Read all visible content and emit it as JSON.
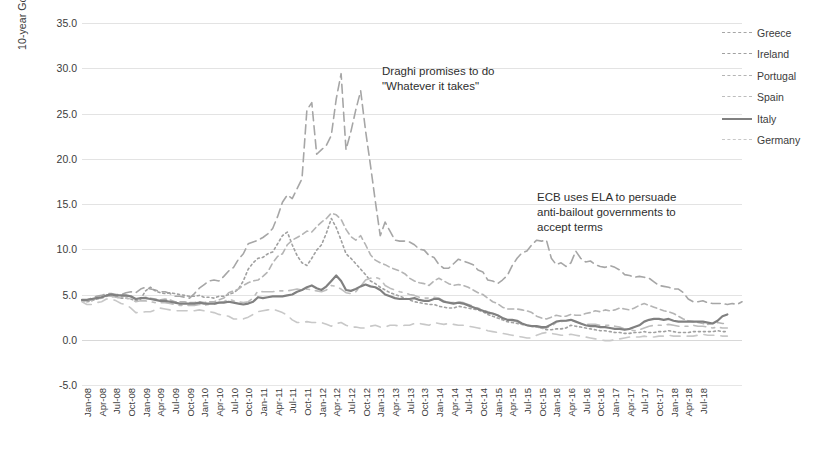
{
  "chart_data": {
    "type": "line",
    "title": "",
    "xlabel": "",
    "ylabel": "10-year Government Bond Yeilds, Percent",
    "ylim": [
      -5.0,
      35.0
    ],
    "ytick_labels": [
      "35.0",
      "30.0",
      "25.0",
      "20.0",
      "15.0",
      "10.0",
      "5.0",
      "0.0",
      "-5.0"
    ],
    "ytick_values": [
      35.0,
      30.0,
      25.0,
      20.0,
      15.0,
      10.0,
      5.0,
      0.0,
      -5.0
    ],
    "grid": true,
    "legend_position": "right",
    "x_tick_labels": [
      "Jan-08",
      "Apr-08",
      "Jul-08",
      "Oct-08",
      "Jan-09",
      "Apr-09",
      "Jul-09",
      "Oct-09",
      "Jan-10",
      "Apr-10",
      "Jul-10",
      "Oct-10",
      "Jan-11",
      "Apr-11",
      "Jul-11",
      "Oct-11",
      "Jan-12",
      "Apr-12",
      "Jul-12",
      "Oct-12",
      "Jan-13",
      "Apr-13",
      "Jul-13",
      "Oct-13",
      "Jan-14",
      "Apr-14",
      "Jul-14",
      "Oct-14",
      "Jan-15",
      "Apr-15",
      "Jul-15",
      "Oct-15",
      "Jan-16",
      "Apr-16",
      "Jul-16",
      "Oct-16",
      "Jan-17",
      "Apr-17",
      "Jul-17",
      "Oct-17",
      "Jan-18",
      "Apr-18",
      "Jul-18"
    ],
    "x_months_start": "Jan-08",
    "x_months_end": "Jul-18",
    "series": [
      {
        "name": "Greece",
        "color": "#a6a6a6",
        "dash": "9 5",
        "width": 1.6,
        "values": [
          4.4,
          4.4,
          4.6,
          4.8,
          4.9,
          5.1,
          5.1,
          5.0,
          5.0,
          5.2,
          5.3,
          5.2,
          5.6,
          5.8,
          5.6,
          5.5,
          5.3,
          5.3,
          5.1,
          4.8,
          4.8,
          4.7,
          4.6,
          5.1,
          5.7,
          6.1,
          6.5,
          6.6,
          6.5,
          7.0,
          7.6,
          8.0,
          8.9,
          9.5,
          10.6,
          10.8,
          11.0,
          11.3,
          11.7,
          12.3,
          13.6,
          15.2,
          16.0,
          15.6,
          16.7,
          17.8,
          25.4,
          26.2,
          20.5,
          21.0,
          21.5,
          22.6,
          26.6,
          29.4,
          21.0,
          23.0,
          25.4,
          27.5,
          23.1,
          19.3,
          15.3,
          11.5,
          13.0,
          12.0,
          11.0,
          10.9,
          10.9,
          10.8,
          10.5,
          10.0,
          9.9,
          9.3,
          9.1,
          8.3,
          7.9,
          7.9,
          8.4,
          8.9,
          8.7,
          8.5,
          8.3,
          7.7,
          7.5,
          6.6,
          6.5,
          6.2,
          6.6,
          7.1,
          8.2,
          9.0,
          9.6,
          9.8,
          10.5,
          11.0,
          10.9,
          11.0,
          9.0,
          8.3,
          8.5,
          8.1,
          8.5,
          9.8,
          9.0,
          8.6,
          8.7,
          8.3,
          8.1,
          8.0,
          8.2,
          8.0,
          7.7,
          7.2,
          7.1,
          6.9,
          7.0,
          6.9,
          6.8,
          6.4,
          6.0,
          5.9,
          5.8,
          5.6,
          5.6,
          5.2,
          4.5,
          4.2,
          4.2,
          4.3,
          4.1,
          4.0,
          4.0,
          4.0,
          3.9,
          4.0,
          3.9,
          4.2
        ]
      },
      {
        "name": "Ireland",
        "color": "#a0a0a0",
        "dash": "2 3",
        "width": 1.6,
        "values": [
          4.3,
          4.2,
          4.3,
          4.5,
          4.6,
          4.8,
          4.8,
          4.7,
          4.6,
          4.6,
          4.5,
          4.3,
          4.5,
          5.4,
          5.8,
          5.4,
          5.2,
          5.1,
          5.2,
          5.1,
          5.0,
          4.9,
          4.8,
          4.8,
          4.9,
          4.7,
          4.7,
          4.6,
          4.8,
          4.8,
          5.0,
          5.2,
          5.6,
          6.5,
          7.8,
          8.5,
          9.0,
          9.1,
          9.5,
          9.7,
          10.6,
          11.5,
          11.9,
          10.5,
          9.3,
          8.5,
          8.2,
          9.0,
          9.9,
          10.5,
          11.8,
          13.4,
          12.4,
          11.0,
          9.5,
          9.0,
          8.4,
          7.8,
          7.2,
          6.5,
          6.2,
          5.8,
          5.5,
          5.2,
          5.0,
          4.8,
          4.6,
          4.4,
          4.2,
          4.1,
          4.0,
          3.9,
          3.9,
          3.7,
          3.6,
          3.5,
          3.5,
          3.7,
          3.6,
          3.5,
          3.4,
          3.3,
          3.1,
          2.8,
          2.6,
          2.4,
          2.2,
          2.0,
          1.9,
          1.8,
          1.7,
          1.6,
          1.5,
          1.4,
          1.3,
          1.1,
          1.1,
          1.2,
          1.2,
          1.3,
          1.6,
          1.5,
          1.4,
          1.3,
          1.2,
          1.1,
          1.0,
          1.0,
          0.9,
          0.8,
          0.8,
          0.7,
          0.7,
          0.8,
          0.8,
          0.9,
          0.8,
          0.8,
          0.9,
          0.9,
          1.0,
          0.9,
          0.8,
          0.8,
          0.8,
          0.9,
          0.9,
          0.9,
          0.9,
          0.9,
          1.0,
          0.9,
          0.9
        ]
      },
      {
        "name": "Portugal",
        "color": "#b4b4b4",
        "dash": "6 4",
        "width": 1.6,
        "values": [
          4.4,
          4.4,
          4.5,
          4.6,
          4.7,
          4.9,
          4.9,
          4.8,
          4.8,
          4.8,
          4.7,
          4.5,
          4.6,
          4.7,
          4.6,
          4.5,
          4.4,
          4.5,
          4.4,
          4.2,
          4.2,
          4.2,
          4.1,
          4.1,
          4.2,
          4.1,
          4.2,
          4.2,
          4.4,
          4.6,
          5.2,
          5.4,
          5.6,
          6.0,
          6.3,
          6.5,
          6.6,
          7.0,
          7.5,
          8.5,
          9.2,
          9.5,
          10.5,
          11.0,
          11.3,
          11.6,
          12.0,
          11.9,
          12.5,
          13.0,
          13.4,
          14.0,
          13.8,
          13.3,
          12.2,
          11.4,
          11.0,
          11.5,
          10.5,
          9.4,
          8.8,
          8.5,
          8.3,
          8.0,
          7.8,
          7.6,
          7.3,
          6.8,
          6.5,
          6.3,
          6.2,
          6.0,
          6.5,
          6.8,
          6.5,
          6.2,
          6.0,
          6.1,
          6.0,
          5.8,
          5.5,
          5.2,
          5.0,
          4.6,
          4.2,
          4.0,
          3.6,
          3.4,
          3.4,
          3.4,
          3.3,
          3.2,
          3.0,
          2.6,
          2.4,
          2.3,
          2.5,
          2.7,
          2.6,
          2.6,
          2.8,
          2.7,
          2.7,
          2.9,
          3.0,
          3.2,
          3.1,
          3.3,
          3.2,
          3.3,
          3.5,
          3.4,
          3.3,
          3.5,
          3.8,
          4.0,
          3.8,
          3.6,
          3.4,
          3.2,
          3.1,
          2.9,
          2.6,
          2.3,
          2.1,
          2.0,
          1.9,
          1.8,
          1.7,
          1.8,
          1.9,
          1.8,
          1.8
        ]
      },
      {
        "name": "Spain",
        "color": "#bdbdbd",
        "dash": "12 6 3 6",
        "width": 1.6,
        "values": [
          4.3,
          4.3,
          4.4,
          4.5,
          4.6,
          4.8,
          4.8,
          4.7,
          4.6,
          4.6,
          4.5,
          4.2,
          4.3,
          4.3,
          4.2,
          4.1,
          4.1,
          4.1,
          4.0,
          3.9,
          3.8,
          3.8,
          3.8,
          3.8,
          3.9,
          3.8,
          3.9,
          3.9,
          4.1,
          4.2,
          4.5,
          4.3,
          4.2,
          4.1,
          4.2,
          4.6,
          5.4,
          5.3,
          5.3,
          5.3,
          5.4,
          5.4,
          5.4,
          5.5,
          5.6,
          5.5,
          5.6,
          5.5,
          5.4,
          5.3,
          5.5,
          6.0,
          5.9,
          5.6,
          5.2,
          5.1,
          5.3,
          5.9,
          6.6,
          6.8,
          6.9,
          6.7,
          6.0,
          5.7,
          5.5,
          5.3,
          5.2,
          5.0,
          4.9,
          4.7,
          4.6,
          4.6,
          4.7,
          4.6,
          4.3,
          4.1,
          4.1,
          4.2,
          4.1,
          3.9,
          3.7,
          3.5,
          3.3,
          3.1,
          2.9,
          2.7,
          2.4,
          2.2,
          2.1,
          2.0,
          1.7,
          1.6,
          1.5,
          1.4,
          1.3,
          1.3,
          1.5,
          1.9,
          2.0,
          2.1,
          2.2,
          2.0,
          1.8,
          1.7,
          1.7,
          1.7,
          1.6,
          1.6,
          1.6,
          1.5,
          1.4,
          1.2,
          1.1,
          1.0,
          1.1,
          1.3,
          1.5,
          1.6,
          1.6,
          1.6,
          1.7,
          1.6,
          1.5,
          1.5,
          1.5,
          1.6,
          1.5,
          1.5,
          1.4,
          1.3,
          1.4,
          1.3,
          1.3
        ]
      },
      {
        "name": "Italy",
        "color": "#808080",
        "dash": "",
        "width": 2.2,
        "values": [
          4.4,
          4.4,
          4.5,
          4.6,
          4.7,
          4.9,
          5.0,
          4.9,
          4.9,
          4.9,
          4.8,
          4.5,
          4.6,
          4.6,
          4.5,
          4.4,
          4.3,
          4.3,
          4.2,
          4.1,
          4.0,
          4.0,
          4.0,
          4.0,
          4.1,
          4.0,
          4.0,
          4.0,
          4.1,
          4.1,
          4.2,
          4.1,
          4.0,
          3.9,
          4.0,
          4.2,
          4.7,
          4.6,
          4.7,
          4.8,
          4.8,
          4.8,
          4.9,
          5.0,
          5.3,
          5.5,
          5.8,
          6.0,
          5.7,
          5.5,
          5.9,
          6.5,
          7.1,
          6.5,
          5.5,
          5.4,
          5.6,
          5.9,
          6.1,
          5.9,
          5.8,
          5.5,
          5.0,
          4.8,
          4.6,
          4.5,
          4.5,
          4.5,
          4.6,
          4.4,
          4.3,
          4.3,
          4.5,
          4.5,
          4.2,
          4.1,
          4.0,
          4.1,
          4.0,
          3.8,
          3.6,
          3.4,
          3.2,
          3.0,
          2.9,
          2.7,
          2.4,
          2.2,
          2.2,
          2.1,
          1.8,
          1.6,
          1.5,
          1.5,
          1.4,
          1.4,
          1.7,
          2.0,
          2.1,
          2.1,
          2.2,
          2.0,
          1.8,
          1.6,
          1.5,
          1.5,
          1.4,
          1.4,
          1.3,
          1.2,
          1.2,
          1.1,
          1.2,
          1.4,
          1.6,
          2.0,
          2.2,
          2.3,
          2.3,
          2.2,
          2.3,
          2.1,
          2.0,
          2.0,
          2.0,
          2.0,
          2.0,
          2.0,
          1.9,
          1.8,
          2.1,
          2.6,
          2.8
        ]
      },
      {
        "name": "Germany",
        "color": "#c8c8c8",
        "dash": "10 7",
        "width": 1.6,
        "values": [
          4.2,
          3.9,
          3.9,
          4.1,
          4.2,
          4.5,
          4.5,
          4.3,
          4.0,
          3.9,
          3.5,
          3.0,
          3.0,
          3.1,
          3.1,
          3.3,
          3.5,
          3.4,
          3.3,
          3.2,
          3.2,
          3.2,
          3.2,
          3.2,
          3.3,
          3.2,
          3.1,
          3.0,
          2.8,
          2.7,
          2.6,
          2.3,
          2.3,
          2.3,
          2.5,
          2.8,
          3.1,
          3.2,
          3.3,
          3.4,
          3.2,
          3.0,
          2.7,
          2.2,
          1.9,
          1.9,
          2.0,
          1.9,
          1.9,
          1.9,
          1.7,
          1.5,
          1.8,
          1.9,
          1.6,
          1.4,
          1.4,
          1.3,
          1.3,
          1.5,
          1.6,
          1.4,
          1.4,
          1.6,
          1.6,
          1.5,
          1.6,
          1.6,
          1.8,
          1.8,
          1.7,
          1.6,
          1.9,
          1.8,
          1.7,
          1.8,
          1.7,
          1.6,
          1.6,
          1.5,
          1.4,
          1.3,
          1.2,
          1.0,
          0.9,
          0.8,
          0.7,
          0.6,
          0.5,
          0.4,
          0.3,
          0.2,
          0.2,
          0.5,
          0.7,
          0.8,
          0.7,
          0.6,
          0.5,
          0.5,
          0.6,
          0.5,
          0.4,
          0.3,
          0.2,
          0.1,
          0.0,
          -0.1,
          -0.1,
          0.0,
          0.1,
          0.2,
          0.3,
          0.3,
          0.3,
          0.4,
          0.3,
          0.3,
          0.4,
          0.4,
          0.5,
          0.4,
          0.4,
          0.4,
          0.4,
          0.4,
          0.5,
          0.6,
          0.5,
          0.5,
          0.5,
          0.4,
          0.4
        ]
      }
    ],
    "annotations": [
      {
        "id": "draghi",
        "text": "Draghi promises to do \"Whatever it takes\""
      },
      {
        "id": "ela",
        "text": "ECB uses ELA to persuade anti-bailout governments to accept terms"
      }
    ]
  }
}
